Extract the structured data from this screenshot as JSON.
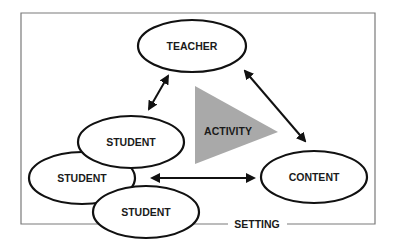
{
  "diagram": {
    "frame_label": "SETTING",
    "center_label": "ACTIVITY",
    "nodes": {
      "teacher": "TEACHER",
      "student_1": "STUDENT",
      "student_2": "STUDENT",
      "student_3": "STUDENT",
      "content": "CONTENT"
    },
    "edges": [
      {
        "from": "TEACHER",
        "to": "STUDENT",
        "type": "bidirectional"
      },
      {
        "from": "TEACHER",
        "to": "CONTENT",
        "type": "bidirectional"
      },
      {
        "from": "STUDENT",
        "to": "CONTENT",
        "type": "bidirectional"
      }
    ],
    "colors": {
      "triangle": "#a9a9a9",
      "stroke": "#111111",
      "frame": "#7a7a7a"
    }
  }
}
